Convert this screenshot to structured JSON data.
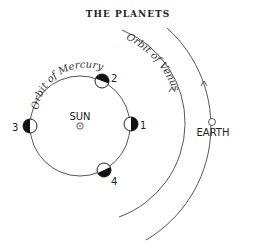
{
  "title": "THE PLANETS",
  "sun": {
    "label": "SUN"
  },
  "earth": {
    "label": "EARTH"
  },
  "orbits": {
    "mercury": "Orbit of Mercury",
    "venus": "Orbit of Venus"
  },
  "mercury_positions": [
    {
      "label": "1"
    },
    {
      "label": "2"
    },
    {
      "label": "3"
    },
    {
      "label": "4"
    }
  ],
  "colors": {
    "ink": "#222222",
    "orbit": "#555555",
    "shade": "#111111"
  }
}
